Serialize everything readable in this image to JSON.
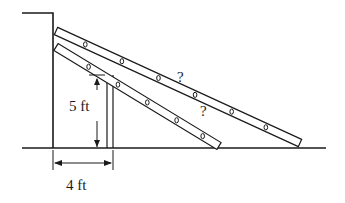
{
  "diagram": {
    "colors": {
      "ink": "#1a1a1a",
      "background": "#ffffff"
    },
    "labels": {
      "fence_height": "5 ft",
      "fence_distance": "4 ft",
      "ladder_upper_unknown": "?",
      "ladder_lower_unknown": "?"
    },
    "elements": {
      "wall": "wall",
      "ground": "ground",
      "fence": "fence",
      "ladders": [
        "ladder-long",
        "ladder-short"
      ]
    },
    "dimensions": {
      "fence_height_ft": 5,
      "fence_distance_from_wall_ft": 4
    }
  }
}
